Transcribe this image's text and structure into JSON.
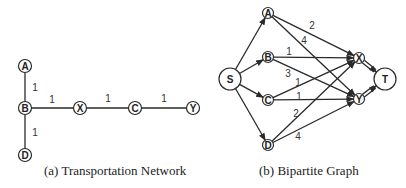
{
  "figure_a": {
    "caption": "(a) Transportation Network",
    "nodes": [
      {
        "id": "A",
        "label": "A",
        "x": 25,
        "y": 66,
        "r": 6.5
      },
      {
        "id": "B",
        "label": "B",
        "x": 25,
        "y": 108,
        "r": 6.5
      },
      {
        "id": "D",
        "label": "D",
        "x": 25,
        "y": 155,
        "r": 6.5
      },
      {
        "id": "X",
        "label": "X",
        "x": 80,
        "y": 108,
        "r": 6.5
      },
      {
        "id": "C",
        "label": "C",
        "x": 135,
        "y": 108,
        "r": 6.5
      },
      {
        "id": "Y",
        "label": "Y",
        "x": 193,
        "y": 108,
        "r": 6.5
      }
    ],
    "edges": [
      {
        "from": "A",
        "to": "B",
        "weight": "1",
        "lx": 35,
        "ly": 91
      },
      {
        "from": "B",
        "to": "D",
        "weight": "1",
        "lx": 35,
        "ly": 136
      },
      {
        "from": "B",
        "to": "X",
        "weight": "1",
        "lx": 52,
        "ly": 103
      },
      {
        "from": "X",
        "to": "C",
        "weight": "1",
        "lx": 108,
        "ly": 102
      },
      {
        "from": "C",
        "to": "Y",
        "weight": "1",
        "lx": 164,
        "ly": 102
      }
    ]
  },
  "figure_b": {
    "caption": "(b) Bipartite Graph",
    "nodes": [
      {
        "id": "S",
        "label": "S",
        "x": 230,
        "y": 79,
        "r": 11
      },
      {
        "id": "A",
        "label": "A",
        "x": 268,
        "y": 13,
        "r": 5.5
      },
      {
        "id": "B",
        "label": "B",
        "x": 268,
        "y": 57,
        "r": 5.5
      },
      {
        "id": "C",
        "label": "C",
        "x": 268,
        "y": 100,
        "r": 5.5
      },
      {
        "id": "D",
        "label": "D",
        "x": 268,
        "y": 145,
        "r": 5.5
      },
      {
        "id": "X",
        "label": "X",
        "x": 359,
        "y": 58,
        "r": 5.5
      },
      {
        "id": "Y",
        "label": "Y",
        "x": 359,
        "y": 99,
        "r": 5.5
      },
      {
        "id": "T",
        "label": "T",
        "x": 385,
        "y": 79,
        "r": 11
      }
    ],
    "edges": [
      {
        "from": "S",
        "to": "A",
        "weight": ""
      },
      {
        "from": "S",
        "to": "B",
        "weight": ""
      },
      {
        "from": "S",
        "to": "C",
        "weight": ""
      },
      {
        "from": "S",
        "to": "D",
        "weight": ""
      },
      {
        "from": "A",
        "to": "X",
        "weight": "2",
        "lx": 312,
        "ly": 29
      },
      {
        "from": "A",
        "to": "Y",
        "weight": "4",
        "lx": 304,
        "ly": 44
      },
      {
        "from": "B",
        "to": "X",
        "weight": "1",
        "lx": 289,
        "ly": 55
      },
      {
        "from": "B",
        "to": "Y",
        "weight": "3",
        "lx": 288,
        "ly": 77
      },
      {
        "from": "C",
        "to": "X",
        "weight": "1",
        "lx": 298,
        "ly": 86
      },
      {
        "from": "C",
        "to": "Y",
        "weight": "1",
        "lx": 299,
        "ly": 100
      },
      {
        "from": "D",
        "to": "X",
        "weight": "2",
        "lx": 296,
        "ly": 117
      },
      {
        "from": "D",
        "to": "Y",
        "weight": "4",
        "lx": 298,
        "ly": 140
      }
    ],
    "double_edges": [
      {
        "from": "X",
        "to": "T"
      },
      {
        "from": "Y",
        "to": "T"
      }
    ]
  }
}
